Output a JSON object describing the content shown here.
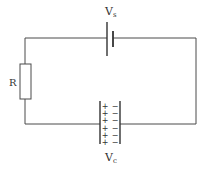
{
  "diagram": {
    "type": "RC circuit",
    "components": {
      "battery": {
        "label_main": "V",
        "label_sub": "s"
      },
      "resistor": {
        "label": "R"
      },
      "capacitor": {
        "label_main": "V",
        "label_sub": "c",
        "positive_signs": [
          "+",
          "+",
          "+",
          "+",
          "+",
          "+"
        ],
        "negative_signs": [
          "−",
          "−",
          "−",
          "−",
          "−",
          "−"
        ]
      }
    },
    "colors": {
      "line": "#4a4a4a",
      "text": "#333333",
      "background": "#ffffff"
    }
  }
}
